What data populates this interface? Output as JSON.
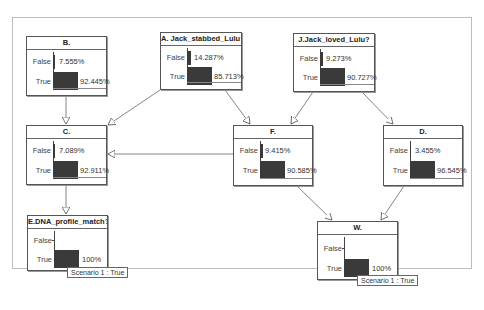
{
  "diagram": {
    "type": "bayesian-network",
    "nodes": [
      {
        "id": "B",
        "title": "B.",
        "states": [
          {
            "label": "False",
            "value": "7.555%",
            "pct": 7.555
          },
          {
            "label": "True",
            "value": "92.445%",
            "pct": 92.445
          }
        ]
      },
      {
        "id": "A",
        "title": "A. Jack_stabbed_Lulu?",
        "states": [
          {
            "label": "False",
            "value": "14.287%",
            "pct": 14.287
          },
          {
            "label": "True",
            "value": "85.713%",
            "pct": 85.713
          }
        ]
      },
      {
        "id": "J",
        "title": "J.Jack_loved_Lulu?",
        "states": [
          {
            "label": "False",
            "value": "9.273%",
            "pct": 9.273
          },
          {
            "label": "True",
            "value": "90.727%",
            "pct": 90.727
          }
        ]
      },
      {
        "id": "C",
        "title": "C.",
        "states": [
          {
            "label": "False",
            "value": "7.089%",
            "pct": 7.089
          },
          {
            "label": "True",
            "value": "92.911%",
            "pct": 92.911
          }
        ]
      },
      {
        "id": "F",
        "title": "F.",
        "states": [
          {
            "label": "False",
            "value": "9.415%",
            "pct": 9.415
          },
          {
            "label": "True",
            "value": "90.585%",
            "pct": 90.585
          }
        ]
      },
      {
        "id": "D",
        "title": "D.",
        "states": [
          {
            "label": "False",
            "value": "3.455%",
            "pct": 3.455
          },
          {
            "label": "True",
            "value": "96.545%",
            "pct": 96.545
          }
        ]
      },
      {
        "id": "E",
        "title": "E.DNA_profile_match?",
        "states": [
          {
            "label": "False",
            "value": "",
            "pct": 0
          },
          {
            "label": "True",
            "value": "100%",
            "pct": 100
          }
        ],
        "scenario": "Scenario 1 : True"
      },
      {
        "id": "W",
        "title": "W.",
        "states": [
          {
            "label": "False",
            "value": "",
            "pct": 0
          },
          {
            "label": "True",
            "value": "100%",
            "pct": 100
          }
        ],
        "scenario": "Scenario 1 : True"
      }
    ],
    "edges": [
      {
        "from": "A",
        "to": "C"
      },
      {
        "from": "A",
        "to": "F"
      },
      {
        "from": "J",
        "to": "F"
      },
      {
        "from": "J",
        "to": "D"
      },
      {
        "from": "B",
        "to": "C"
      },
      {
        "from": "F",
        "to": "C"
      },
      {
        "from": "C",
        "to": "E"
      },
      {
        "from": "F",
        "to": "W"
      },
      {
        "from": "D",
        "to": "W"
      }
    ]
  }
}
